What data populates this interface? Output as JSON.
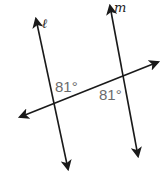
{
  "diagram": {
    "type": "parallel-lines-transversal",
    "lines": {
      "l": {
        "label": "ℓ",
        "from": [
          68,
          170
        ],
        "to": [
          36,
          18
        ]
      },
      "m": {
        "label": "m",
        "from": [
          139,
          157
        ],
        "to": [
          110,
          5
        ]
      },
      "transversal": {
        "label": "",
        "from": [
          20,
          118
        ],
        "to": [
          159,
          62
        ]
      }
    },
    "angles": [
      {
        "label": "81°",
        "position": "upper-right at intersection with ℓ"
      },
      {
        "label": "81°",
        "position": "lower-left at intersection with m"
      }
    ]
  },
  "labels": {
    "line_l": "ℓ",
    "line_m": "m",
    "angle_1": "81°",
    "angle_2": "81°"
  }
}
